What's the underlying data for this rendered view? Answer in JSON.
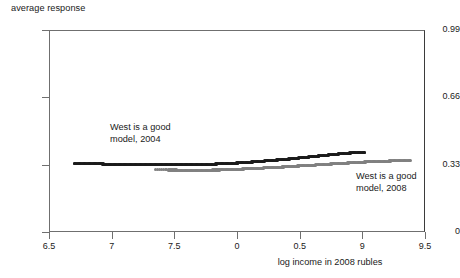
{
  "chart_data": {
    "type": "scatter",
    "title": "",
    "ylabel": "average response",
    "xlabel": "log income in 2008 rubles",
    "xlim": [
      6.5,
      9.5
    ],
    "ylim": [
      0,
      0.99
    ],
    "grid": false,
    "legend_position": "inline-annotation",
    "xticks": [
      6.5,
      7,
      7.5,
      8,
      8.5,
      9,
      9.5
    ],
    "xticklabels": [
      "6.5",
      "7",
      "7.5",
      "0",
      "0.5",
      "9",
      "9.5"
    ],
    "yticks": [
      0,
      0.33,
      0.66,
      0.99
    ],
    "yticklabels": [
      "0",
      "0.33",
      "0.66",
      "0.99"
    ],
    "series": [
      {
        "name": "West is a good model, 2004",
        "color": "#1b1b1b",
        "annotation": "West is a good\nmodel, 2004",
        "annotation_line1": "West is a good",
        "annotation_line2": "model, 2004",
        "x": [
          6.7,
          6.74,
          6.78,
          6.82,
          6.86,
          6.9,
          6.94,
          6.98,
          7.02,
          7.06,
          7.1,
          7.14,
          7.18,
          7.22,
          7.26,
          7.3,
          7.34,
          7.38,
          7.42,
          7.46,
          7.5,
          7.54,
          7.58,
          7.62,
          7.66,
          7.7,
          7.74,
          7.78,
          7.82,
          7.86,
          7.9,
          7.94,
          7.98,
          8.02,
          8.06,
          8.1,
          8.14,
          8.18,
          8.22,
          8.26,
          8.3,
          8.34,
          8.38,
          8.42,
          8.46,
          8.5,
          8.54,
          8.58,
          8.62,
          8.66,
          8.7,
          8.74,
          8.78,
          8.82,
          8.86,
          8.9,
          8.94,
          8.98,
          9.02
        ],
        "y": [
          0.336,
          0.336,
          0.335,
          0.335,
          0.334,
          0.334,
          0.333,
          0.333,
          0.332,
          0.332,
          0.331,
          0.331,
          0.33,
          0.33,
          0.33,
          0.329,
          0.329,
          0.329,
          0.329,
          0.329,
          0.329,
          0.329,
          0.329,
          0.33,
          0.33,
          0.331,
          0.331,
          0.332,
          0.333,
          0.334,
          0.335,
          0.336,
          0.337,
          0.339,
          0.34,
          0.342,
          0.344,
          0.346,
          0.348,
          0.35,
          0.352,
          0.354,
          0.356,
          0.358,
          0.361,
          0.363,
          0.366,
          0.368,
          0.371,
          0.373,
          0.376,
          0.378,
          0.381,
          0.383,
          0.385,
          0.387,
          0.389,
          0.39,
          0.391
        ]
      },
      {
        "name": "West is a good model, 2008",
        "color": "#808080",
        "annotation": "West is a good\nmodel, 2008",
        "annotation_line1": "West is a good",
        "annotation_line2": "model, 2008",
        "x": [
          7.35,
          7.45,
          7.5,
          7.54,
          7.58,
          7.62,
          7.66,
          7.7,
          7.74,
          7.78,
          7.82,
          7.86,
          7.9,
          7.94,
          7.98,
          8.02,
          8.06,
          8.1,
          8.14,
          8.18,
          8.22,
          8.26,
          8.3,
          8.34,
          8.38,
          8.42,
          8.46,
          8.5,
          8.54,
          8.58,
          8.62,
          8.66,
          8.7,
          8.74,
          8.78,
          8.82,
          8.86,
          8.9,
          8.94,
          8.98,
          9.02,
          9.06,
          9.1,
          9.14,
          9.18,
          9.22,
          9.26,
          9.3,
          9.34,
          9.38
        ],
        "y": [
          0.305,
          0.304,
          0.304,
          0.303,
          0.303,
          0.303,
          0.303,
          0.303,
          0.303,
          0.303,
          0.304,
          0.304,
          0.305,
          0.306,
          0.307,
          0.308,
          0.309,
          0.31,
          0.311,
          0.312,
          0.314,
          0.315,
          0.316,
          0.318,
          0.319,
          0.321,
          0.322,
          0.324,
          0.325,
          0.327,
          0.328,
          0.33,
          0.331,
          0.333,
          0.334,
          0.336,
          0.337,
          0.339,
          0.34,
          0.341,
          0.343,
          0.344,
          0.345,
          0.346,
          0.347,
          0.348,
          0.349,
          0.35,
          0.351,
          0.352
        ]
      }
    ]
  }
}
